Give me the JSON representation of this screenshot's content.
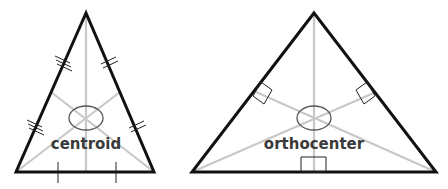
{
  "diagrams": [
    {
      "id": "centroid",
      "label": "centroid",
      "description": "Triangle with three medians meeting at the centroid; sides marked with equal-length tick marks",
      "colors": {
        "sides": "#111111",
        "medians": "#c8c8c8",
        "marks": "#222222",
        "label": "#3a3a3a"
      }
    },
    {
      "id": "orthocenter",
      "label": "orthocenter",
      "description": "Triangle with three altitudes meeting at the orthocenter; right-angle markers at the feet of each altitude",
      "colors": {
        "sides": "#111111",
        "altitudes": "#c8c8c8",
        "marks": "#222222",
        "label": "#3a3a3a"
      }
    }
  ]
}
